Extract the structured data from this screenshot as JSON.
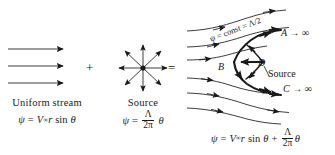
{
  "figure": {
    "background_color": "#ffffff",
    "ink_color": "#1a1a1a",
    "width": 335,
    "height": 155
  },
  "operators": {
    "plus": "+",
    "equals": "="
  },
  "panels": {
    "uniform_stream": {
      "caption": "Uniform stream",
      "formula": {
        "lhs": "ψ",
        "eq": "=",
        "speed_symbol": "V",
        "speed_subscript": "∞",
        "radius": "r",
        "trig": "sin",
        "angle": "θ"
      },
      "arrow_count": 3
    },
    "source": {
      "caption": "Source",
      "formula": {
        "lhs": "ψ",
        "eq": "=",
        "numerator": "Λ",
        "denominator": "2π",
        "angle": "θ"
      },
      "ray_count": 8
    },
    "half_body": {
      "formula": {
        "lhs": "ψ",
        "eq": "=",
        "speed_symbol": "V",
        "speed_subscript": "∞",
        "radius": "r",
        "trig": "sin",
        "angle": "θ",
        "plus": "+",
        "numerator": "Λ",
        "denominator": "2π",
        "angle2": "θ"
      },
      "labels": {
        "point_a": "A → ∞",
        "point_b": "B",
        "point_d": "D",
        "source": "Source",
        "point_c": "C → ∞",
        "dividing_streamline": "ψ = const = Λ/2"
      },
      "streamline_count": 6,
      "dividing_streamline_weight": "bold"
    }
  }
}
